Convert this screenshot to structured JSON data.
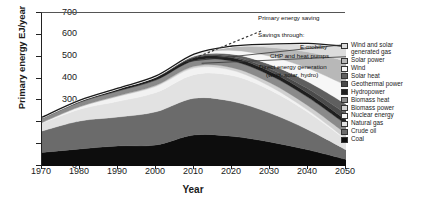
{
  "chart_data": {
    "type": "area",
    "title": "",
    "xlabel": "Year",
    "ylabel": "Primary energy EJ/year",
    "xlim": [
      1970,
      2050
    ],
    "ylim": [
      0,
      700
    ],
    "xticks": [
      1970,
      1980,
      1990,
      2000,
      2010,
      2020,
      2030,
      2040,
      2050
    ],
    "yticks": [
      0,
      100,
      200,
      300,
      400,
      500,
      600,
      700
    ],
    "grid": false,
    "legend_position": "right",
    "stacking_order_bottom_to_top": [
      "Coal",
      "Crude oil",
      "Natural gas",
      "Nuclear energy",
      "Biomass power",
      "Biomass heat",
      "Hydropower",
      "Geothermal power",
      "Solar heat",
      "Wind",
      "Solar power",
      "Wind and solar generated gas"
    ],
    "x": [
      1970,
      1980,
      1990,
      2000,
      2010,
      2020,
      2030,
      2040,
      2050
    ],
    "series": [
      {
        "name": "Coal",
        "color": "#0d0d0d",
        "values": [
          62,
          78,
          92,
          96,
          142,
          136,
          110,
          74,
          30
        ]
      },
      {
        "name": "Crude oil",
        "color": "#6b6b6b",
        "values": [
          98,
          128,
          132,
          152,
          168,
          160,
          132,
          92,
          44
        ]
      },
      {
        "name": "Natural gas",
        "color": "#e2e2e2",
        "values": [
          36,
          54,
          72,
          88,
          108,
          118,
          106,
          80,
          46
        ]
      },
      {
        "name": "Nuclear energy",
        "color": "#f2f2f2",
        "values": [
          2,
          10,
          22,
          28,
          30,
          24,
          16,
          9,
          4
        ]
      },
      {
        "name": "Biomass power",
        "color": "#d0d0d0",
        "values": [
          1,
          2,
          3,
          5,
          8,
          12,
          17,
          21,
          24
        ]
      },
      {
        "name": "Biomass heat",
        "color": "#8a8a8a",
        "values": [
          18,
          20,
          22,
          24,
          26,
          30,
          34,
          38,
          42
        ]
      },
      {
        "name": "Hydropower",
        "color": "#1f1f1f",
        "values": [
          6,
          8,
          10,
          12,
          13,
          15,
          17,
          19,
          21
        ]
      },
      {
        "name": "Geothermal power",
        "color": "#4a4a4a",
        "values": [
          0,
          1,
          1,
          2,
          3,
          6,
          12,
          20,
          28
        ]
      },
      {
        "name": "Solar heat",
        "color": "#5f5f5f",
        "values": [
          0,
          0,
          1,
          2,
          4,
          10,
          20,
          32,
          44
        ]
      },
      {
        "name": "Wind",
        "color": "#f7f7f7",
        "values": [
          0,
          0,
          1,
          2,
          6,
          18,
          38,
          62,
          86
        ]
      },
      {
        "name": "Solar power",
        "color": "#b8b8b8",
        "values": [
          0,
          0,
          0,
          1,
          4,
          16,
          40,
          74,
          110
        ]
      },
      {
        "name": "Wind and solar generated gas",
        "color": "#dcdcdc",
        "values": [
          0,
          0,
          0,
          0,
          0,
          4,
          16,
          40,
          68
        ]
      }
    ],
    "reference_line": {
      "name": "Primary energy saving",
      "style": "dashed",
      "x": [
        2008,
        2028
      ],
      "y": [
        478,
        620
      ]
    },
    "annotations": [
      {
        "text": "Primary energy saving"
      },
      {
        "text": "Savings through:"
      },
      {
        "text": "E-mobility"
      },
      {
        "text": "CHP and heat pumps"
      },
      {
        "text": "Direct energy generation"
      },
      {
        "text": "(wind, solar, hydro)"
      }
    ]
  },
  "legend": {
    "items": [
      {
        "label": "Wind and solar",
        "label2": "generated gas",
        "color": "#dcdcdc"
      },
      {
        "label": "Solar power",
        "label2": "",
        "color": "#b8b8b8"
      },
      {
        "label": "Wind",
        "label2": "",
        "color": "#f7f7f7"
      },
      {
        "label": "Solar heat",
        "label2": "",
        "color": "#5f5f5f"
      },
      {
        "label": "Geothermal power",
        "label2": "",
        "color": "#4a4a4a"
      },
      {
        "label": "Hydropower",
        "label2": "",
        "color": "#1f1f1f"
      },
      {
        "label": "Biomass heat",
        "label2": "",
        "color": "#8a8a8a"
      },
      {
        "label": "Biomass power",
        "label2": "",
        "color": "#d0d0d0"
      },
      {
        "label": "Nuclear energy",
        "label2": "",
        "color": "#f2f2f2"
      },
      {
        "label": "Natural gas",
        "label2": "",
        "color": "#e2e2e2"
      },
      {
        "label": "Crude oil",
        "label2": "",
        "color": "#6b6b6b"
      },
      {
        "label": "Coal",
        "label2": "",
        "color": "#0d0d0d"
      }
    ]
  }
}
